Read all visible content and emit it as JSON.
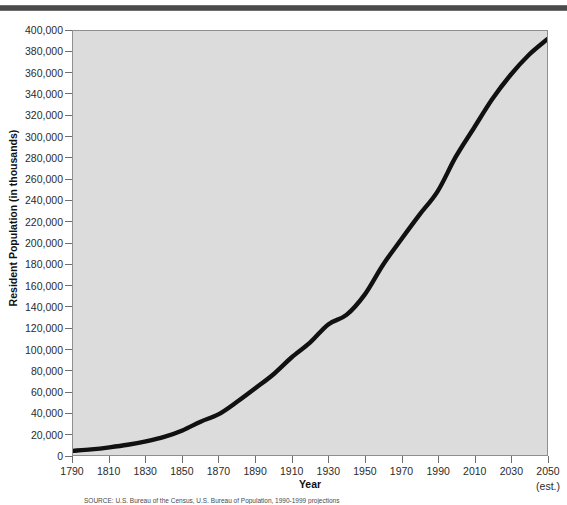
{
  "figure": {
    "source_note": "SOURCE: U.S. Bureau of the Census, U.S. Bureau of Population, 1990-1999 projections"
  },
  "chart_data": {
    "type": "line",
    "title": "",
    "xlabel": "Year",
    "ylabel": "Resident Population (in thousands)",
    "xlim": [
      1790,
      2050
    ],
    "ylim": [
      0,
      400000
    ],
    "grid": false,
    "legend": null,
    "x_tick_labels": [
      "1790",
      "1810",
      "1830",
      "1850",
      "1870",
      "1890",
      "1910",
      "1930",
      "1950",
      "1970",
      "1990",
      "2010",
      "2030",
      "2050"
    ],
    "x_tick_sublabels": [
      "",
      "",
      "",
      "",
      "",
      "",
      "",
      "",
      "",
      "",
      "",
      "",
      "",
      "(est.)"
    ],
    "y_tick_labels": [
      "0",
      "20,000",
      "40,000",
      "60,000",
      "80,000",
      "100,000",
      "120,000",
      "140,000",
      "160,000",
      "180,000",
      "200,000",
      "220,000",
      "240,000",
      "260,000",
      "280,000",
      "300,000",
      "320,000",
      "340,000",
      "360,000",
      "380,000",
      "400,000"
    ],
    "y_tick_values": [
      0,
      20000,
      40000,
      60000,
      80000,
      100000,
      120000,
      140000,
      160000,
      180000,
      200000,
      220000,
      240000,
      260000,
      280000,
      300000,
      320000,
      340000,
      360000,
      380000,
      400000
    ],
    "x": [
      1790,
      1800,
      1810,
      1820,
      1830,
      1840,
      1850,
      1860,
      1870,
      1880,
      1890,
      1900,
      1910,
      1920,
      1930,
      1940,
      1950,
      1960,
      1970,
      1980,
      1990,
      2000,
      2010,
      2020,
      2030,
      2040,
      2050
    ],
    "series": [
      {
        "name": "Resident Population",
        "color": "#111111",
        "line_width": 4.4,
        "values": [
          3929,
          5308,
          7240,
          9638,
          12866,
          17069,
          23192,
          31443,
          38558,
          50189,
          62980,
          76212,
          92228,
          106021,
          123202,
          132165,
          151326,
          179323,
          203302,
          226542,
          248710,
          281422,
          308746,
          335805,
          358471,
          377350,
          392031
        ]
      }
    ]
  }
}
